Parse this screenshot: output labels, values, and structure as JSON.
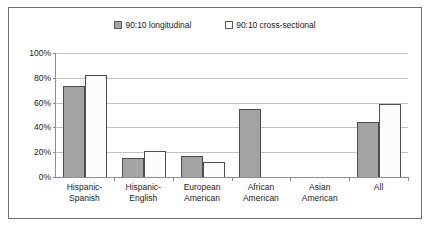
{
  "chart_data": {
    "type": "bar",
    "title": "",
    "subtitle": "",
    "xlabel": "",
    "ylabel": "",
    "ylim": [
      0,
      100
    ],
    "ytick_labels": [
      "100%",
      "80%",
      "60%",
      "40%",
      "20%",
      "0%"
    ],
    "ytick_values": [
      100,
      80,
      60,
      40,
      20,
      0
    ],
    "grid": true,
    "legend_position": "top-center",
    "categories": [
      "Hispanic-Spanish",
      "Hispanic-English",
      "European American",
      "African American",
      "Asian American",
      "All"
    ],
    "category_lines": [
      [
        "Hispanic-",
        "Spanish"
      ],
      [
        "Hispanic-",
        "English"
      ],
      [
        "European",
        "American"
      ],
      [
        "African",
        "American"
      ],
      [
        "Asian",
        "American"
      ],
      [
        "All",
        ""
      ]
    ],
    "series": [
      {
        "name": "90:10 longitudinal",
        "color": "#a3a3a3",
        "values": [
          73,
          15,
          17,
          55,
          null,
          44
        ]
      },
      {
        "name": "90:10 cross-sectional",
        "color": "#fcfcfc",
        "values": [
          82,
          21,
          12,
          null,
          null,
          59
        ]
      }
    ]
  },
  "legend": {
    "entries": [
      {
        "label": "90:10 longitudinal",
        "swatch": "filled"
      },
      {
        "label": "90:10 cross-sectional",
        "swatch": "hollow"
      }
    ]
  },
  "colors": {
    "frame_border": "#6f6f6f",
    "axis": "#8e8e8e",
    "gridline": "#c2c2c2",
    "bar_border": "#4d4d4d",
    "series_longitudinal": "#a3a3a3",
    "series_cross_sectional": "#fcfcfc",
    "text": "#1b1b1b"
  }
}
